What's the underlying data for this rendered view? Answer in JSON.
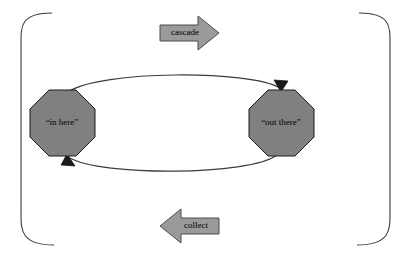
{
  "diagram": {
    "type": "cycle-diagram",
    "background_color": "#ffffff",
    "nodes": [
      {
        "id": "in-here",
        "label": "“in here”",
        "shape": "octagon",
        "fill_color": "#808080",
        "stroke_color": "#000000",
        "cx": 62,
        "cy": 123,
        "size": 66
      },
      {
        "id": "out-there",
        "label": "“out there”",
        "shape": "octagon",
        "fill_color": "#808080",
        "stroke_color": "#000000",
        "cx": 281,
        "cy": 123,
        "size": 66
      }
    ],
    "block_arrows": [
      {
        "id": "cascade-arrow",
        "label": "cascade",
        "direction": "right",
        "fill_color": "#9a9a9a",
        "stroke_color": "#4d4d4d"
      },
      {
        "id": "collect-arrow",
        "label": "collect",
        "direction": "left",
        "fill_color": "#9a9a9a",
        "stroke_color": "#4d4d4d"
      }
    ],
    "curved_connectors": [
      {
        "id": "top-connector",
        "from": "in-here",
        "to": "out-there",
        "direction": "left-to-right",
        "stroke_color": "#3c3c3c"
      },
      {
        "id": "bottom-connector",
        "from": "out-there",
        "to": "in-here",
        "direction": "right-to-left",
        "stroke_color": "#3c3c3c"
      }
    ],
    "brackets": [
      {
        "id": "left-bracket",
        "side": "left",
        "stroke_color": "#3c3c3c"
      },
      {
        "id": "right-bracket",
        "side": "right",
        "stroke_color": "#3c3c3c"
      }
    ]
  }
}
